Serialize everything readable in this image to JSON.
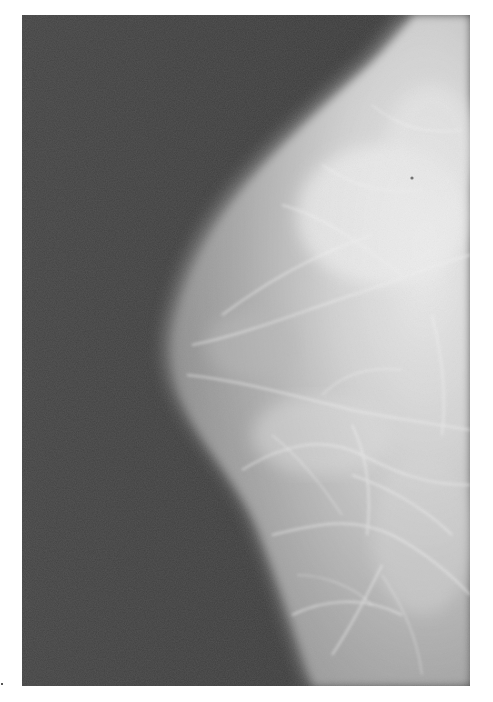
{
  "image": {
    "kind": "mammogram",
    "description": "Grayscale X-ray mammogram showing breast tissue against dark background",
    "colors": {
      "page_background": "#ffffff",
      "background_dark": "#3e3e3e",
      "tissue_mid": "#9a9a9a",
      "tissue_bright": "#e6e6e6"
    },
    "frame": {
      "left": 22,
      "top": 15,
      "width": 448,
      "height": 671
    }
  }
}
